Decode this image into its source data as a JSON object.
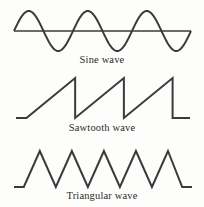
{
  "figure": {
    "background_color": "#fdfdfc",
    "stroke_color": "#3a3a3a",
    "caption_color": "#2b2b2b"
  },
  "panels": [
    {
      "id": "sine",
      "caption": "Sine wave",
      "wave_type": "sine",
      "cycles": 3,
      "peaks": 3,
      "troughs": 3,
      "has_axis": true
    },
    {
      "id": "sawtooth",
      "caption": "Sawtooth wave",
      "wave_type": "sawtooth",
      "cycles": 3,
      "teeth": 3,
      "has_axis": false
    },
    {
      "id": "triangular",
      "caption": "Triangular wave",
      "wave_type": "triangular",
      "cycles": 5,
      "peaks": 5,
      "has_axis": false
    }
  ],
  "chart_data": {
    "type": "line",
    "title": "",
    "xlabel": "",
    "ylabel": "",
    "grid": false,
    "legend_position": "none",
    "axis_ranges": {
      "x": [
        0,
        1
      ],
      "y": [
        -1,
        1
      ]
    },
    "series": [
      {
        "name": "Sine wave",
        "cycles": 3,
        "amplitude": 1,
        "baseline": 0,
        "points": [
          [
            0.0,
            0.0
          ],
          [
            0.042,
            0.63
          ],
          [
            0.083,
            0.97
          ],
          [
            0.125,
            0.88
          ],
          [
            0.167,
            0.41
          ],
          [
            0.208,
            -0.21
          ],
          [
            0.25,
            -0.76
          ],
          [
            0.292,
            -1.0
          ],
          [
            0.333,
            -0.7
          ],
          [
            0.375,
            -0.14
          ],
          [
            0.417,
            0.5
          ],
          [
            0.458,
            0.93
          ],
          [
            0.5,
            0.95
          ],
          [
            0.542,
            0.55
          ],
          [
            0.583,
            -0.06
          ],
          [
            0.625,
            -0.64
          ],
          [
            0.667,
            -0.98
          ],
          [
            0.708,
            -0.85
          ],
          [
            0.75,
            -0.36
          ],
          [
            0.792,
            0.27
          ],
          [
            0.833,
            0.8
          ],
          [
            0.875,
            1.0
          ],
          [
            0.917,
            0.67
          ],
          [
            0.958,
            0.09
          ],
          [
            1.0,
            -0.56
          ]
        ]
      },
      {
        "name": "Sawtooth wave",
        "cycles": 3,
        "amplitude": 1,
        "baseline": -1,
        "points": [
          [
            0.0,
            -1.0
          ],
          [
            0.06,
            -1.0
          ],
          [
            0.34,
            1.0
          ],
          [
            0.34,
            -1.0
          ],
          [
            0.62,
            1.0
          ],
          [
            0.62,
            -1.0
          ],
          [
            0.9,
            1.0
          ],
          [
            0.9,
            -1.0
          ],
          [
            1.0,
            -1.0
          ]
        ]
      },
      {
        "name": "Triangular wave",
        "cycles": 5,
        "amplitude": 1,
        "baseline": -1,
        "points": [
          [
            0.0,
            -1.0
          ],
          [
            0.055,
            -1.0
          ],
          [
            0.145,
            1.0
          ],
          [
            0.235,
            -1.0
          ],
          [
            0.325,
            1.0
          ],
          [
            0.415,
            -1.0
          ],
          [
            0.505,
            1.0
          ],
          [
            0.595,
            -1.0
          ],
          [
            0.685,
            1.0
          ],
          [
            0.775,
            -1.0
          ],
          [
            0.865,
            1.0
          ],
          [
            0.945,
            -1.0
          ],
          [
            1.0,
            -1.0
          ]
        ]
      }
    ]
  }
}
